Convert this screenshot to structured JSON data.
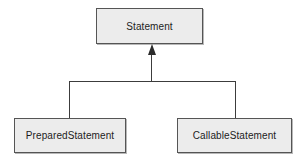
{
  "diagram": {
    "type": "uml-class-hierarchy",
    "relationship": "generalization",
    "colors": {
      "box_fill": "#ececec",
      "box_border": "#555555",
      "text": "#1c1c1c",
      "connector": "#3c3c3c",
      "arrowhead": "#2b2b2b",
      "background": "#ffffff"
    },
    "nodes": {
      "parent": {
        "label": "Statement"
      },
      "children": [
        {
          "label": "PreparedStatement"
        },
        {
          "label": "CallableStatement"
        }
      ]
    }
  }
}
